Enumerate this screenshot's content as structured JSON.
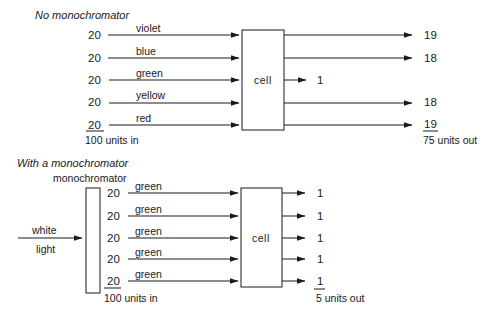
{
  "top": {
    "title": "No monochromator",
    "inputs": [
      {
        "value": "20",
        "color": "violet"
      },
      {
        "value": "20",
        "color": "blue"
      },
      {
        "value": "20",
        "color": "green"
      },
      {
        "value": "20",
        "color": "yellow"
      },
      {
        "value": "20",
        "color": "red"
      }
    ],
    "total_in": "100 units in",
    "cell_label": "cell",
    "absorbed": "1",
    "outputs": [
      "19",
      "18",
      "18",
      "19"
    ],
    "total_out": "75 units out"
  },
  "bottom": {
    "title": "With a monochromator",
    "monochromator_label": "monochromator",
    "source_label_line1": "white",
    "source_label_line2": "light",
    "inputs": [
      {
        "value": "20",
        "color": "green"
      },
      {
        "value": "20",
        "color": "green"
      },
      {
        "value": "20",
        "color": "green"
      },
      {
        "value": "20",
        "color": "green"
      },
      {
        "value": "20",
        "color": "green"
      }
    ],
    "total_in": "100 units in",
    "cell_label": "cell",
    "outputs": [
      "1",
      "1",
      "1",
      "1",
      "1"
    ],
    "total_out": "5 units out"
  }
}
